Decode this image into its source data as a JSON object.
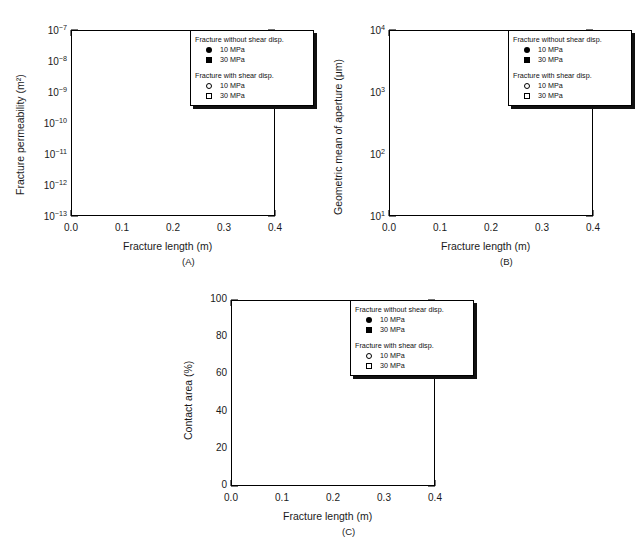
{
  "figure": {
    "caption_fragment": "",
    "panel_tags": [
      "(A)",
      "(B)",
      "(C)"
    ]
  },
  "legend": {
    "title_without": "Fracture without shear disp.",
    "title_with": "Fracture with shear disp.",
    "entries": [
      {
        "marker": "filled-circle",
        "label": "10 MPa"
      },
      {
        "marker": "filled-square",
        "label": "30 MPa"
      },
      {
        "marker": "open-circle",
        "label": "10 MPa"
      },
      {
        "marker": "open-square",
        "label": "30 MPa"
      }
    ]
  },
  "chart_data": [
    {
      "type": "scatter",
      "panel": "(A)",
      "title": "",
      "xlabel": "Fracture length (m)",
      "ylabel": "Fracture permeability (m²)",
      "xlim": [
        0.0,
        0.4
      ],
      "xticks": [
        0.0,
        0.1,
        0.2,
        0.3,
        0.4
      ],
      "xticklabels": [
        "0.0",
        "0.1",
        "0.2",
        "0.3",
        "0.4"
      ],
      "yscale": "log",
      "ylim": [
        1e-13,
        1e-07
      ],
      "yticks": [
        1e-13,
        1e-12,
        1e-11,
        1e-10,
        1e-09,
        1e-08,
        1e-07
      ],
      "yticklabels": [
        "10^-13",
        "10^-12",
        "10^-11",
        "10^-10",
        "10^-9",
        "10^-8",
        "10^-7"
      ],
      "grid": false,
      "legend_position": "upper-right",
      "series": [
        {
          "name": "Fracture without shear disp. 10 MPa",
          "marker": "filled-circle",
          "x": [
            0.05,
            0.1,
            0.2
          ],
          "y": [
            6.5e-12,
            7.5e-12,
            4e-12
          ]
        },
        {
          "name": "Fracture without shear disp. 30 MPa",
          "marker": "filled-square",
          "x": [
            0.05,
            0.1,
            0.2
          ],
          "y": [
            1.5e-12,
            2e-12,
            1e-12
          ]
        },
        {
          "name": "Fracture with shear disp. 10 MPa",
          "marker": "open-circle",
          "x": [
            0.05,
            0.1,
            0.2
          ],
          "y": [
            1.2e-09,
            3.2e-09,
            4.2e-09
          ]
        },
        {
          "name": "Fracture with shear disp. 30 MPa",
          "marker": "open-square",
          "x": [
            0.05,
            0.1,
            0.2
          ],
          "y": [
            1.2e-09,
            3e-09,
            3.7e-09
          ]
        }
      ]
    },
    {
      "type": "scatter",
      "panel": "(B)",
      "title": "",
      "xlabel": "Fracture length (m)",
      "ylabel": "Geometric mean of aperture (μm)",
      "xlim": [
        0.0,
        0.4
      ],
      "xticks": [
        0.0,
        0.1,
        0.2,
        0.3,
        0.4
      ],
      "xticklabels": [
        "0.0",
        "0.1",
        "0.2",
        "0.3",
        "0.4"
      ],
      "yscale": "log",
      "ylim": [
        10,
        10000
      ],
      "yticks": [
        10,
        100,
        1000,
        10000
      ],
      "yticklabels": [
        "10^1",
        "10^2",
        "10^3",
        "10^4"
      ],
      "grid": false,
      "legend_position": "upper-right",
      "series": [
        {
          "name": "Fracture without shear disp. 10 MPa",
          "marker": "filled-circle",
          "x": [
            0.05,
            0.1,
            0.2
          ],
          "y": [
            72,
            165,
            190
          ]
        },
        {
          "name": "Fracture without shear disp. 30 MPa",
          "marker": "filled-square",
          "x": [
            0.05,
            0.1,
            0.2
          ],
          "y": [
            70,
            160,
            185
          ]
        },
        {
          "name": "Fracture with shear disp. 10 MPa",
          "marker": "open-circle",
          "x": [
            0.05,
            0.1,
            0.2
          ],
          "y": [
            250,
            620,
            440
          ]
        },
        {
          "name": "Fracture with shear disp. 30 MPa",
          "marker": "open-square",
          "x": [
            0.05,
            0.1,
            0.2
          ],
          "y": [
            248,
            610,
            450
          ]
        }
      ]
    },
    {
      "type": "scatter",
      "panel": "(C)",
      "title": "",
      "xlabel": "Fracture length (m)",
      "ylabel": "Contact area (%)",
      "xlim": [
        0.0,
        0.4
      ],
      "xticks": [
        0.0,
        0.1,
        0.2,
        0.3,
        0.4
      ],
      "xticklabels": [
        "0.0",
        "0.1",
        "0.2",
        "0.3",
        "0.4"
      ],
      "yscale": "linear",
      "ylim": [
        0,
        100
      ],
      "yticks": [
        0,
        20,
        40,
        60,
        80,
        100
      ],
      "yticklabels": [
        "0",
        "20",
        "40",
        "60",
        "80",
        "100"
      ],
      "grid": false,
      "legend_position": "upper-right",
      "series": [
        {
          "name": "Fracture without shear disp. 10 MPa",
          "marker": "filled-circle",
          "x": [
            0.05,
            0.1,
            0.2
          ],
          "y": [
            62.5,
            55.0,
            51.0
          ]
        },
        {
          "name": "Fracture without shear disp. 30 MPa",
          "marker": "filled-square",
          "x": [
            0.05,
            0.1,
            0.2
          ],
          "y": [
            66.0,
            56.0,
            57.5
          ]
        },
        {
          "name": "Fracture with shear disp. 10 MPa",
          "marker": "open-circle",
          "x": [
            0.05,
            0.1,
            0.2
          ],
          "y": [
            40.0,
            40.5,
            42.0
          ]
        },
        {
          "name": "Fracture with shear disp. 30 MPa",
          "marker": "open-square",
          "x": [
            0.05,
            0.1,
            0.2
          ],
          "y": [
            40.0,
            41.5,
            42.5
          ]
        }
      ]
    }
  ]
}
